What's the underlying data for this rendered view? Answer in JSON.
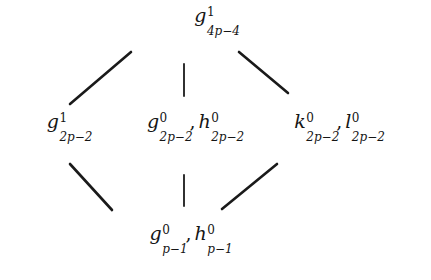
{
  "diagram": {
    "type": "hasse-lattice",
    "background_color": "#ffffff",
    "line_color": "#1a1a1a",
    "text_color": "#151515",
    "nodes": [
      {
        "id": "top",
        "position": "top",
        "terms": [
          {
            "base": "g",
            "sup": "1",
            "sub": "4p−4"
          }
        ],
        "label": "g^1_{4p-4}"
      },
      {
        "id": "mid-left",
        "position": "middle-left",
        "terms": [
          {
            "base": "g",
            "sup": "1",
            "sub": "2p−2"
          }
        ],
        "label": "g^1_{2p-2}"
      },
      {
        "id": "mid-center",
        "position": "middle-center",
        "terms": [
          {
            "base": "g",
            "sup": "0",
            "sub": "2p−2"
          },
          {
            "base": "h",
            "sup": "0",
            "sub": "2p−2"
          }
        ],
        "label": "g^0_{2p-2}, h^0_{2p-2}"
      },
      {
        "id": "mid-right",
        "position": "middle-right",
        "terms": [
          {
            "base": "k",
            "sup": "0",
            "sub": "2p−2"
          },
          {
            "base": "l",
            "sup": "0",
            "sub": "2p−2"
          }
        ],
        "label": "k^0_{2p-2}, l^0_{2p-2}"
      },
      {
        "id": "bottom",
        "position": "bottom",
        "terms": [
          {
            "base": "g",
            "sup": "0",
            "sub": "p−1"
          },
          {
            "base": "h",
            "sup": "0",
            "sub": "p−1"
          }
        ],
        "label": "g^0_{p-1}, h^0_{p-1}"
      }
    ],
    "edges": [
      {
        "id": "edge-top-left",
        "from": "mid-left",
        "to": "top",
        "x1": 70,
        "y1": 104,
        "x2": 131,
        "y2": 52,
        "style": "diagonal"
      },
      {
        "id": "edge-top-center",
        "from": "mid-center",
        "to": "top",
        "x1": 184,
        "y1": 96,
        "x2": 184,
        "y2": 64,
        "style": "vertical"
      },
      {
        "id": "edge-top-right",
        "from": "mid-right",
        "to": "top",
        "x1": 239,
        "y1": 52,
        "x2": 288,
        "y2": 93,
        "style": "diagonal"
      },
      {
        "id": "edge-bottom-left",
        "from": "bottom",
        "to": "mid-left",
        "x1": 70,
        "y1": 164,
        "x2": 112,
        "y2": 210,
        "style": "diagonal"
      },
      {
        "id": "edge-bottom-center",
        "from": "bottom",
        "to": "mid-center",
        "x1": 184,
        "y1": 175,
        "x2": 184,
        "y2": 206,
        "style": "vertical"
      },
      {
        "id": "edge-bottom-right",
        "from": "bottom",
        "to": "mid-right",
        "x1": 222,
        "y1": 209,
        "x2": 277,
        "y2": 164,
        "style": "diagonal"
      }
    ]
  }
}
